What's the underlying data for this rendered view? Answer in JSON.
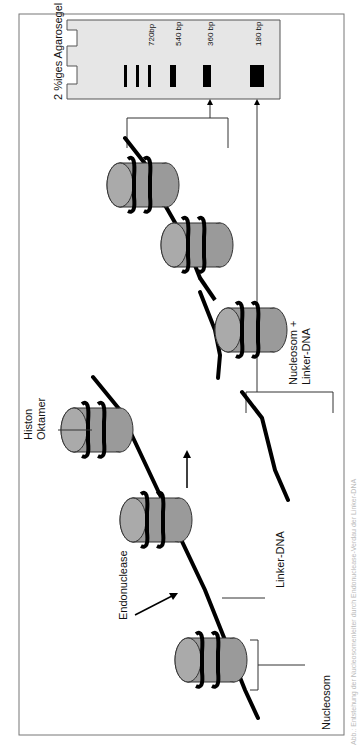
{
  "diagram": {
    "type": "nucleosome-ladder-digestion",
    "orientation": "rotated-90-ccw",
    "labels": {
      "gel_title": "2 %iges Agarosegel",
      "histon_oktamer_line1": "Histon",
      "histon_oktamer_line2": "Oktamer",
      "endonuclease": "Endonuclease",
      "linker_dna": "Linker-DNA",
      "nucleosom": "Nucleosom",
      "nucleosom_linker_line1": "Nucleosom +",
      "nucleosom_linker_line2": "Linker-DNA"
    },
    "gel": {
      "bands": [
        {
          "label": "720bp",
          "size_bp": 720
        },
        {
          "label": "540 bp",
          "size_bp": 540
        },
        {
          "label": "360 bp",
          "size_bp": 360
        },
        {
          "label": "180 bp",
          "size_bp": 180
        }
      ],
      "fill_color": "#e6e6e6",
      "band_color": "#000000"
    },
    "colors": {
      "histone": "#9a9a9a",
      "histone_top": "#a8a8a8",
      "dna": "#000000",
      "frame": "#777777"
    },
    "caption": "Abb.: Entstehung der Nucleosomenleiter durch Endonuclease-Verdau der Linker-DNA"
  }
}
